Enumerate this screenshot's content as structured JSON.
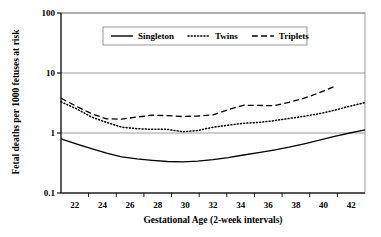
{
  "chart_data": {
    "type": "line",
    "title": "",
    "xlabel": "Gestational Age (2-week intervals)",
    "ylabel": "Fetal deaths per 1000 fetuses at risk",
    "x": [
      22,
      23,
      24,
      25,
      26,
      27,
      28,
      29,
      30,
      31,
      32,
      33,
      34,
      35,
      36,
      37,
      38,
      39,
      40,
      41,
      42
    ],
    "categories": [
      "22",
      "24",
      "26",
      "28",
      "30",
      "32",
      "34",
      "36",
      "38",
      "40",
      "42"
    ],
    "xtick_labels": [
      "22",
      "24",
      "26",
      "28",
      "30",
      "32",
      "34",
      "36",
      "38",
      "40",
      "42"
    ],
    "ytick_labels": [
      "100",
      "10",
      "1",
      "0.1"
    ],
    "ytick_values": [
      100,
      10,
      1,
      0.1
    ],
    "yscale": "log",
    "ylim": [
      0.1,
      100
    ],
    "xlim": [
      22,
      42
    ],
    "grid": "horizontal",
    "legend_position": "top-center",
    "series": [
      {
        "name": "Singleton",
        "style": "solid",
        "color": "#000000",
        "x": [
          22,
          23,
          24,
          25,
          26,
          27,
          28,
          29,
          30,
          31,
          32,
          33,
          34,
          35,
          36,
          37,
          38,
          39,
          40,
          41,
          42
        ],
        "values": [
          0.8,
          0.66,
          0.55,
          0.46,
          0.4,
          0.37,
          0.35,
          0.335,
          0.33,
          0.34,
          0.36,
          0.39,
          0.43,
          0.47,
          0.52,
          0.58,
          0.66,
          0.76,
          0.88,
          1.0,
          1.13
        ]
      },
      {
        "name": "Twins",
        "style": "dotted",
        "color": "#000000",
        "x": [
          22,
          23,
          24,
          25,
          26,
          27,
          28,
          29,
          30,
          31,
          32,
          33,
          34,
          35,
          36,
          37,
          38,
          39,
          40,
          41,
          42
        ],
        "values": [
          3.3,
          2.55,
          1.85,
          1.5,
          1.25,
          1.18,
          1.15,
          1.15,
          1.05,
          1.1,
          1.25,
          1.35,
          1.45,
          1.5,
          1.6,
          1.75,
          1.9,
          2.1,
          2.4,
          2.8,
          3.2
        ]
      },
      {
        "name": "Triplets",
        "style": "dashed",
        "color": "#000000",
        "x": [
          22,
          23,
          24,
          25,
          26,
          27,
          28,
          29,
          30,
          31,
          32,
          33,
          34,
          35,
          36,
          37,
          38,
          39,
          40
        ],
        "values": [
          3.8,
          2.8,
          2.1,
          1.72,
          1.7,
          1.85,
          1.98,
          1.95,
          1.88,
          1.92,
          2.0,
          2.45,
          2.9,
          2.88,
          2.85,
          3.25,
          3.8,
          4.7,
          6.0
        ]
      }
    ]
  },
  "legend": {
    "items": [
      {
        "label": "Singleton",
        "style": "solid"
      },
      {
        "label": "Twins",
        "style": "dotted"
      },
      {
        "label": "Triplets",
        "style": "dashed"
      }
    ]
  },
  "axes": {
    "y_title": "Fetal deaths per 1000 fetuses at risk",
    "x_title": "Gestational Age (2-week intervals)"
  }
}
